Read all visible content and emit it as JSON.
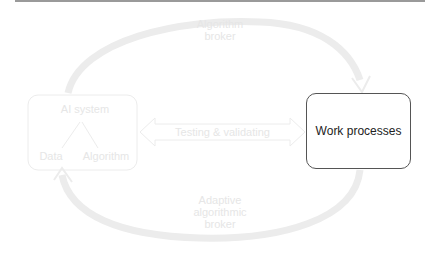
{
  "diagram": {
    "ai_system": {
      "title": "AI system",
      "children": [
        "Data",
        "Algorithm"
      ]
    },
    "work_processes": {
      "label": "Work processes"
    },
    "arrows": {
      "top": {
        "line1": "Algorithm",
        "line2": "broker"
      },
      "middle": {
        "label": "Testing & validating"
      },
      "bottom": {
        "line1": "Adaptive",
        "line2": "algorithmic",
        "line3": "broker"
      }
    },
    "colors": {
      "faded": "#e6e6e6",
      "box_border": "#555555",
      "top_rule": "#9a9a9a"
    }
  }
}
